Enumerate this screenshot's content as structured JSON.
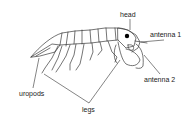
{
  "diagram": {
    "labels": {
      "head": "head",
      "antenna1": "antenna 1",
      "antenna2": "antenna 2",
      "uropods": "uropods",
      "legs": "legs"
    },
    "colors": {
      "background": "#ffffff",
      "line": "#3a3a3a",
      "eye": "#000000",
      "text": "#222222"
    }
  }
}
